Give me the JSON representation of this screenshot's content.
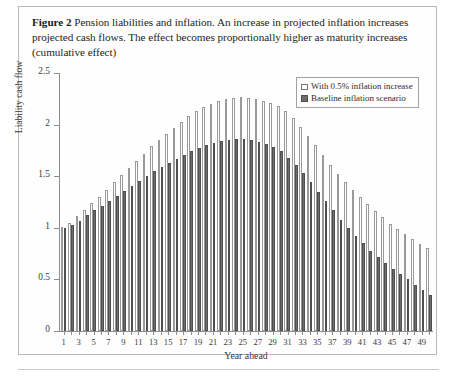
{
  "figure": {
    "label": "Figure 2",
    "caption": "Pension liabilities and inflation. An increase in projected inflation increases projected cash flows. The effect becomes proportionally higher as maturity increases  (cumulative effect)"
  },
  "legend": {
    "position": "top-right",
    "items": [
      {
        "name": "With 0.5% inflation increase",
        "swatch": "light"
      },
      {
        "name": "Baseline inflation scenario",
        "swatch": "dark"
      }
    ]
  },
  "colors": {
    "light_bar_fill": "#ffffff",
    "light_bar_edge": "#9a9a9a",
    "dark_bar_fill": "#6d6d6d",
    "dark_bar_edge": "#4f4f4f",
    "axis": "#8d8d8d",
    "frame": "#b9b9b9",
    "text": "#231f20"
  },
  "chart_data": {
    "type": "bar",
    "title": "Pension liabilities and inflation",
    "xlabel": "Year ahead",
    "ylabel": "Liability cash flow",
    "ylim": [
      0,
      2.5
    ],
    "yticks": [
      0,
      0.5,
      1,
      1.5,
      2,
      2.5
    ],
    "ytick_labels": [
      "0",
      "0.5",
      "1",
      "1.5",
      "2",
      "2.5"
    ],
    "xticks": [
      1,
      2,
      3,
      4,
      5,
      6,
      7,
      8,
      9,
      10,
      11,
      12,
      13,
      14,
      15,
      16,
      17,
      18,
      19,
      20,
      21,
      22,
      23,
      24,
      25,
      26,
      27,
      28,
      29,
      30,
      31,
      32,
      33,
      34,
      35,
      36,
      37,
      38,
      39,
      40,
      41,
      42,
      43,
      44,
      45,
      46,
      47,
      48,
      49,
      50
    ],
    "xtick_labels_shown": [
      1,
      3,
      5,
      7,
      9,
      11,
      13,
      15,
      17,
      19,
      21,
      23,
      25,
      27,
      29,
      31,
      33,
      35,
      37,
      39,
      41,
      43,
      45,
      47,
      49
    ],
    "grid": false,
    "legend_position": "upper right",
    "categories": [
      1,
      2,
      3,
      4,
      5,
      6,
      7,
      8,
      9,
      10,
      11,
      12,
      13,
      14,
      15,
      16,
      17,
      18,
      19,
      20,
      21,
      22,
      23,
      24,
      25,
      26,
      27,
      28,
      29,
      30,
      31,
      32,
      33,
      34,
      35,
      36,
      37,
      38,
      39,
      40,
      41,
      42,
      43,
      44,
      45,
      46,
      47,
      48,
      49,
      50
    ],
    "series": [
      {
        "name": "With 0.5% inflation increase",
        "values": [
          1.01,
          1.05,
          1.11,
          1.17,
          1.24,
          1.3,
          1.37,
          1.44,
          1.51,
          1.58,
          1.65,
          1.72,
          1.79,
          1.85,
          1.91,
          1.97,
          2.03,
          2.08,
          2.13,
          2.17,
          2.2,
          2.23,
          2.25,
          2.26,
          2.27,
          2.26,
          2.25,
          2.23,
          2.21,
          2.18,
          2.13,
          2.06,
          1.98,
          1.89,
          1.8,
          1.71,
          1.61,
          1.52,
          1.44,
          1.37,
          1.3,
          1.23,
          1.16,
          1.1,
          1.04,
          0.99,
          0.94,
          0.89,
          0.84,
          0.8
        ]
      },
      {
        "name": "Baseline inflation scenario",
        "values": [
          1.0,
          1.03,
          1.07,
          1.12,
          1.17,
          1.21,
          1.26,
          1.31,
          1.36,
          1.41,
          1.45,
          1.5,
          1.55,
          1.59,
          1.63,
          1.67,
          1.71,
          1.74,
          1.77,
          1.8,
          1.82,
          1.84,
          1.85,
          1.86,
          1.86,
          1.85,
          1.83,
          1.81,
          1.78,
          1.74,
          1.68,
          1.61,
          1.53,
          1.44,
          1.35,
          1.26,
          1.17,
          1.08,
          1.0,
          0.92,
          0.85,
          0.78,
          0.72,
          0.66,
          0.6,
          0.55,
          0.5,
          0.45,
          0.4,
          0.35
        ]
      }
    ]
  }
}
